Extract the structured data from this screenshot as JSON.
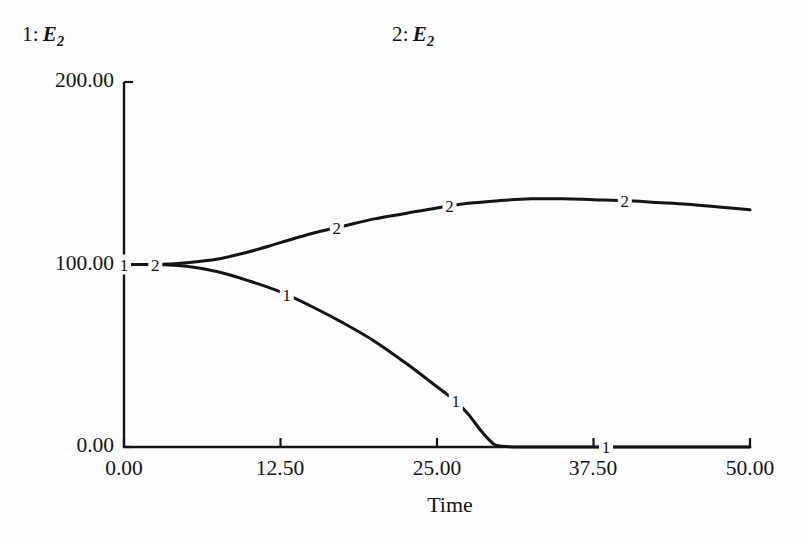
{
  "chart_data": {
    "type": "line",
    "title": "",
    "xlabel": "Time",
    "ylabel": "",
    "xlim": [
      0,
      50
    ],
    "ylim": [
      0,
      200
    ],
    "xticks": [
      "0.00",
      "12.50",
      "25.00",
      "37.50",
      "50.00"
    ],
    "yticks": [
      "0.00",
      "100.00",
      "200.00"
    ],
    "grid": false,
    "legend_position": "top",
    "legend": [
      {
        "index": "1:",
        "label": "E",
        "subscript": "2"
      },
      {
        "index": "2:",
        "label": "E",
        "subscript": "2"
      }
    ],
    "series": [
      {
        "name": "1",
        "marker_label": "1",
        "x": [
          0,
          2.5,
          5,
          7.5,
          10,
          12.5,
          15,
          17.5,
          20,
          22.5,
          25,
          26.5,
          27.5,
          28.5,
          29.3,
          30,
          32.5,
          35,
          37.5,
          40,
          45,
          50
        ],
        "y": [
          100,
          100,
          99,
          96,
          91,
          85,
          77,
          68,
          58,
          46,
          33,
          25,
          18,
          9,
          3,
          0.5,
          0,
          0,
          0,
          0,
          0,
          0
        ],
        "markers_at_x": [
          0,
          13,
          26.5,
          38.5
        ]
      },
      {
        "name": "2",
        "marker_label": "2",
        "x": [
          0,
          2.5,
          5,
          7.5,
          10,
          12.5,
          15,
          17.5,
          20,
          22.5,
          25,
          27.5,
          30,
          32.5,
          35,
          37.5,
          40,
          42.5,
          45,
          47.5,
          50
        ],
        "y": [
          100,
          100,
          101,
          103,
          107,
          112,
          117,
          121,
          125,
          128,
          131,
          133.5,
          135,
          136,
          136,
          135.5,
          135,
          134,
          133,
          131.5,
          130
        ],
        "markers_at_x": [
          2.5,
          17,
          26,
          40
        ]
      }
    ]
  },
  "axis": {
    "y_top_label": "200.00",
    "y_mid_label": "100.00",
    "y_bottom_label": "0.00",
    "x_labels": [
      "0.00",
      "12.50",
      "25.00",
      "37.50",
      "50.00"
    ],
    "x_title": "Time"
  },
  "legend": {
    "entry1_index": "1:",
    "entry1_var": "E",
    "entry1_sub": "2",
    "entry2_index": "2:",
    "entry2_var": "E",
    "entry2_sub": "2"
  },
  "colors": {
    "line": "#141414",
    "axis": "#141414",
    "background": "#fdfdfd"
  }
}
